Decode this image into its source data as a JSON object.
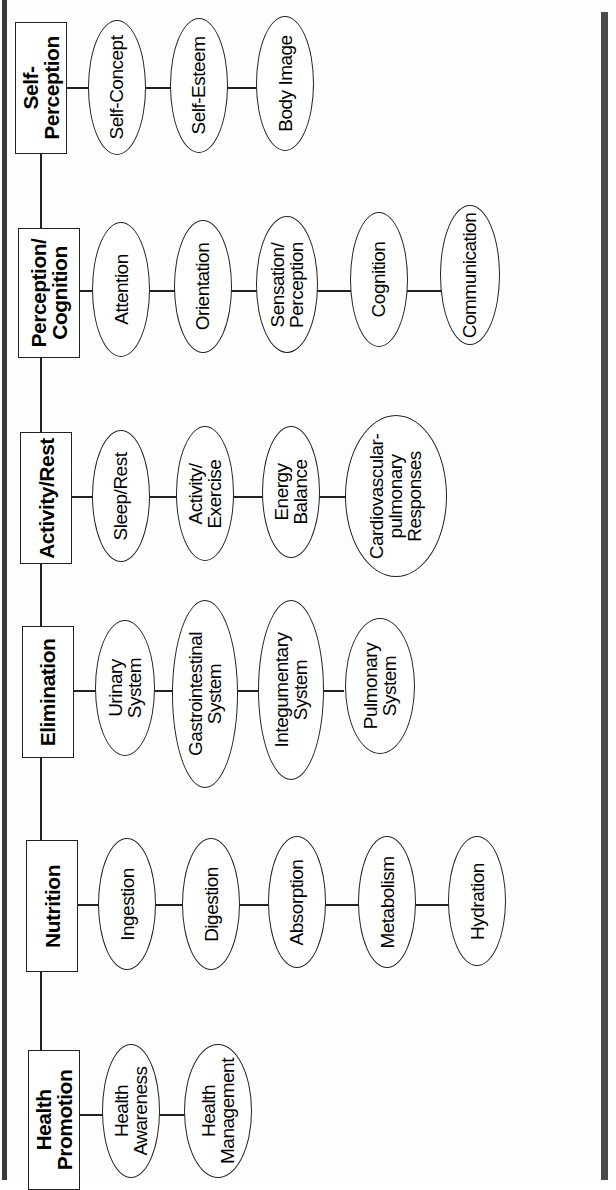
{
  "diagram": {
    "categories": [
      {
        "label": "Self-\nPerception",
        "items": [
          "Self-Concept",
          "Self-Esteem",
          "Body Image"
        ]
      },
      {
        "label": "Perception/\nCognition",
        "items": [
          "Attention",
          "Orientation",
          "Sensation/\nPerception",
          "Cognition",
          "Communication"
        ]
      },
      {
        "label": "Activity/Rest",
        "items": [
          "Sleep/Rest",
          "Activity/\nExercise",
          "Energy\nBalance",
          "Cardiovascular-\npulmonary\nResponses"
        ]
      },
      {
        "label": "Elimination",
        "items": [
          "Urinary\nSystem",
          "Gastrointestinal\nSystem",
          "Integumentary\nSystem",
          "Pulmonary\nSystem"
        ]
      },
      {
        "label": "Nutrition",
        "items": [
          "Ingestion",
          "Digestion",
          "Absorption",
          "Metabolism",
          "Hydration"
        ]
      },
      {
        "label": "Health\nPromotion",
        "items": [
          "Health\nAwareness",
          "Health\nManagement"
        ]
      }
    ]
  }
}
